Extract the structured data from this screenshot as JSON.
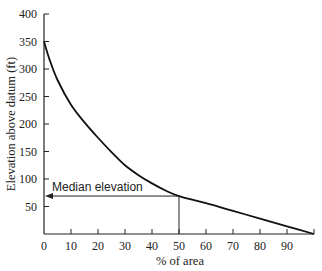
{
  "chart_data": {
    "type": "line",
    "title": "",
    "xlabel": "% of area",
    "ylabel": "Elevation above datum (ft)",
    "xlim": [
      0,
      100
    ],
    "ylim": [
      0,
      400
    ],
    "x_ticks": [
      0,
      10,
      20,
      30,
      40,
      50,
      60,
      70,
      80,
      90
    ],
    "y_ticks": [
      50,
      100,
      150,
      200,
      250,
      300,
      350,
      400
    ],
    "grid": false,
    "legend": null,
    "series": [
      {
        "name": "Hypsometric curve",
        "x": [
          0,
          2,
          5,
          10,
          15,
          20,
          25,
          30,
          35,
          40,
          45,
          50,
          60,
          70,
          80,
          90,
          100
        ],
        "y": [
          350,
          318,
          280,
          235,
          203,
          175,
          149,
          125,
          107,
          92,
          79,
          69,
          56,
          42,
          28,
          14,
          0
        ]
      }
    ],
    "annotations": [
      {
        "text": "Median elevation",
        "type": "arrow-to-axis",
        "x": 50,
        "y": 69
      }
    ]
  }
}
